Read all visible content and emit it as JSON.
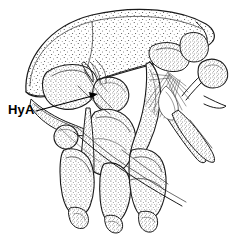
{
  "figure": {
    "kind": "scientific-line-drawing",
    "background_color": "#ffffff",
    "ink_color": "#1a1a1a",
    "width_px": 242,
    "height_px": 236,
    "labels": [
      {
        "id": "hya",
        "text": "HyA",
        "x": 8,
        "y": 114,
        "leader": {
          "from_x": 36,
          "from_y": 111,
          "to_x": 98,
          "to_y": 94,
          "has_arrowhead": true
        }
      }
    ],
    "parts": [
      {
        "name": "carapace-dome",
        "note": "large stippled dome spanning upper area"
      },
      {
        "name": "antennal-scale",
        "note": "rounded stippled lobe at left under dome"
      },
      {
        "name": "mouthpart-cluster",
        "note": "dense stippled appendages at center"
      },
      {
        "name": "seta-fan",
        "note": "radiating bristle fan at right of center"
      },
      {
        "name": "stalked-eye",
        "note": "club-shaped stalked organ at far right"
      },
      {
        "name": "pereopod-left",
        "note": "stippled walking leg, lower left"
      },
      {
        "name": "pereopod-right",
        "note": "stippled walking leg, lower right"
      },
      {
        "name": "dactyl-tips",
        "note": "claw-like terminal segments at bottom"
      }
    ]
  }
}
